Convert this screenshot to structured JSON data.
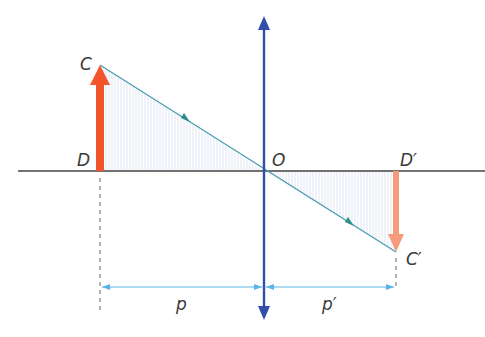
{
  "diagram": {
    "type": "thin converging lens image formation",
    "labels": {
      "object_top": "C",
      "object_base": "D",
      "optical_center": "O",
      "image_base": "D′",
      "image_top": "C′",
      "object_distance": "p",
      "image_distance": "p′"
    },
    "colors": {
      "axis": "#333333",
      "lens": "#2f4fa8",
      "object_arrow": "#f2552c",
      "image_arrow": "#f59a7a",
      "ray": "#4a9bb0",
      "dimension": "#5ab4e6",
      "shading": "#e8ecf6"
    }
  }
}
